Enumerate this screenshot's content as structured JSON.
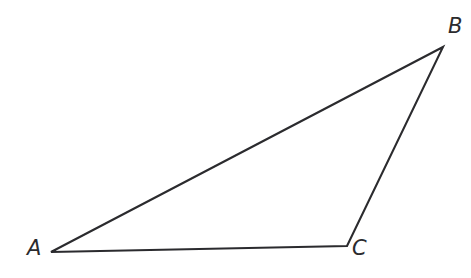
{
  "figure": {
    "kind": "geometry-diagram",
    "shape": "triangle",
    "background_color": "#ffffff",
    "stroke_color": "#2b2b2e",
    "stroke_width": 2.1,
    "canvas": {
      "width": 471,
      "height": 278
    }
  },
  "labels": {
    "a": "A",
    "b": "B",
    "c": "C"
  },
  "chart_data": {
    "type": "diagram",
    "title": "",
    "vertices": [
      {
        "name": "A",
        "x": 51,
        "y": 252,
        "label": "A",
        "label_x": 27,
        "label_y": 238
      },
      {
        "name": "B",
        "x": 443,
        "y": 47,
        "label": "B",
        "label_x": 448,
        "label_y": 16
      },
      {
        "name": "C",
        "x": 347,
        "y": 246,
        "label": "C",
        "label_x": 352,
        "label_y": 238
      }
    ],
    "edges": [
      {
        "from": "A",
        "to": "B"
      },
      {
        "from": "B",
        "to": "C"
      },
      {
        "from": "C",
        "to": "A"
      }
    ],
    "path": "M 51 252 L 443 47 L 347 246 Z",
    "fill": "none",
    "grid": false,
    "legend": null
  }
}
